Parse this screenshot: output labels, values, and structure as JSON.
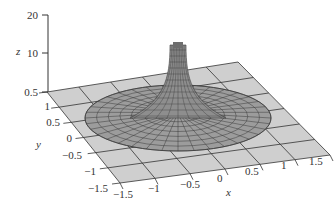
{
  "chart_data": {
    "type": "surface3d",
    "title": "",
    "xlabel": "x",
    "ylabel": "y",
    "zlabel": "z",
    "xlim": [
      -1.5,
      1.5
    ],
    "ylim": [
      -1.5,
      1.5
    ],
    "zlim": [
      0.5,
      20
    ],
    "x_ticks": [
      "−1.5",
      "−1",
      "−0.5",
      "0",
      "0.5",
      "1",
      "1.5"
    ],
    "y_ticks": [
      "−1.5",
      "−1",
      "−0.5",
      "0",
      "0.5",
      "1"
    ],
    "z_ticks": [
      "0.5",
      "10",
      "20"
    ],
    "plane_z": 0.5,
    "surface_radius": 1.0,
    "surface_peak_z": 20,
    "grid": true,
    "legend": null,
    "colors": {
      "plane": "#cfcfcf",
      "grid_line": "#333333",
      "surface": "#9a9a9a",
      "mesh_line": "#3a3a3a",
      "axis": "#333333"
    }
  }
}
